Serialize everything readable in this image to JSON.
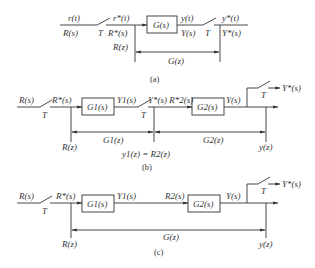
{
  "diagrams": {
    "a": {
      "caption": "(a)",
      "input_top": "r(t)",
      "input_bottom": "R(s)",
      "switch1_label": "T",
      "sampled_top": "r*(t)",
      "sampled_bottom": "R*(s)",
      "block": "G(s)",
      "out_top": "y(t)",
      "out_bottom": "Y(s)",
      "switch2_label": "T",
      "final_top": "y*(t)",
      "final_bottom": "Y*(s)",
      "z_input": "R(z)",
      "z_transfer": "G(z)"
    },
    "b": {
      "caption": "(b)",
      "input": "R(s)",
      "switch1_label": "T",
      "sampled": "R*(s)",
      "block1": "G1(s)",
      "out1": "Y1(s)",
      "switch2_label": "T",
      "sampled2": "Y*(s) R*2(s)",
      "block2": "G2(s)",
      "out2": "Y(s)",
      "switch3_label": "T",
      "final": "Y*(s)",
      "z_input": "R(z)",
      "z_transfer1": "G1(z)",
      "z_transfer2": "G2(z)",
      "z_output": "y(z)",
      "relation": "y1(z) = R2(z)"
    },
    "c": {
      "caption": "(c)",
      "input": "R(s)",
      "switch1_label": "T",
      "sampled": "R*(s)",
      "block1": "G1(s)",
      "out1": "Y1(s)",
      "in2": "R2(s)",
      "block2": "G2(s)",
      "out2": "Y(s)",
      "switch3_label": "T",
      "final": "Y*(s)",
      "z_input": "R(z)",
      "z_transfer": "G(z)",
      "z_output": "y(z)"
    }
  }
}
